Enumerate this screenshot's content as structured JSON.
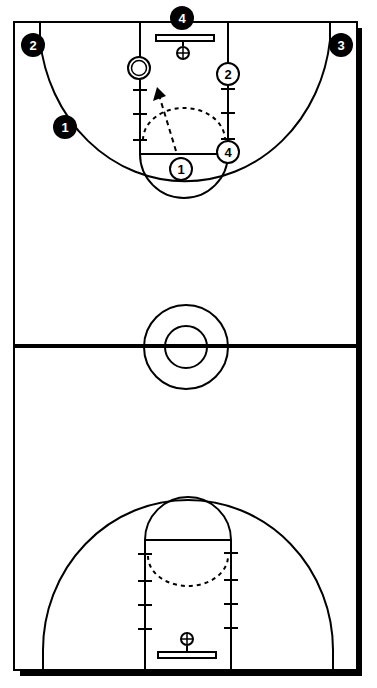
{
  "diagram": {
    "type": "basketball-play",
    "colors": {
      "line": "#000000",
      "background": "#ffffff",
      "offense_fill": "#ffffff",
      "defense_fill": "#000000"
    },
    "defense_players": [
      {
        "label": "4",
        "x": 182,
        "y": 18
      },
      {
        "label": "2",
        "x": 33,
        "y": 45
      },
      {
        "label": "3",
        "x": 341,
        "y": 45
      },
      {
        "label": "1",
        "x": 65,
        "y": 127
      }
    ],
    "offense_players": [
      {
        "label": "2",
        "x": 228,
        "y": 74
      },
      {
        "label": "4",
        "x": 228,
        "y": 152
      },
      {
        "label": "1",
        "x": 181,
        "y": 169
      }
    ],
    "ball": {
      "x": 139,
      "y": 68
    },
    "cut_arrow": {
      "from": [
        176,
        151
      ],
      "to": [
        157,
        89
      ],
      "style": "dashed"
    }
  }
}
